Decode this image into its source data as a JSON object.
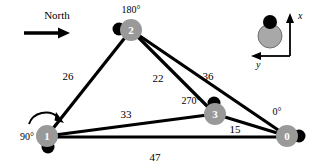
{
  "figure": {
    "type": "robot-network-diagram",
    "background": "#ffffff",
    "node_fill": "#999999",
    "node_text_color": "#ffffff",
    "marker_color": "#000000",
    "edge_color": "#000000",
    "legend_fill": "#a8a8a8",
    "legend_stroke": "#6e6e6e"
  },
  "north_indicator": {
    "label": "North",
    "arrow": "arrow-right"
  },
  "rotation_indicator": {
    "icon": "curved-arrow-clockwise"
  },
  "legend": {
    "x_axis_label": "x",
    "y_axis_label": "y",
    "robot_icon": "robot-heading-marker"
  },
  "nodes": [
    {
      "id": "0",
      "label": "0",
      "angle_label": "0°",
      "cx": 287,
      "cy": 136,
      "r": 11,
      "marker_dx": 12,
      "marker_dy": 0,
      "marker_r": 6.5,
      "angle_x": 277,
      "angle_y": 115
    },
    {
      "id": "1",
      "label": "1",
      "angle_label": "90°",
      "cx": 47,
      "cy": 136,
      "r": 11,
      "marker_dx": 1,
      "marker_dy": 11,
      "marker_r": 6.5,
      "angle_x": 10,
      "angle_y": 140
    },
    {
      "id": "2",
      "label": "2",
      "angle_label": "180°",
      "cx": 131,
      "cy": 30,
      "r": 11,
      "marker_dx": -12,
      "marker_dy": -1,
      "marker_r": 6.5,
      "angle_x": 115,
      "angle_y": 12
    },
    {
      "id": "3",
      "label": "3",
      "angle_label": "270°",
      "cx": 215,
      "cy": 114,
      "r": 11,
      "marker_dx": -1,
      "marker_dy": -11,
      "marker_r": 6.5,
      "angle_x": 176,
      "angle_y": 103
    }
  ],
  "edges": [
    {
      "from": "1",
      "to": "2",
      "value": "26",
      "label_x": 68,
      "label_y": 80
    },
    {
      "from": "2",
      "to": "3",
      "value": "22",
      "label_x": 158,
      "label_y": 82
    },
    {
      "from": "2",
      "to": "0",
      "value": "36",
      "label_x": 208,
      "label_y": 80
    },
    {
      "from": "1",
      "to": "3",
      "value": "33",
      "label_x": 126,
      "label_y": 118
    },
    {
      "from": "3",
      "to": "0",
      "value": "15",
      "label_x": 235,
      "label_y": 133
    },
    {
      "from": "1",
      "to": "0",
      "value": "47",
      "label_x": 155,
      "label_y": 161
    }
  ]
}
